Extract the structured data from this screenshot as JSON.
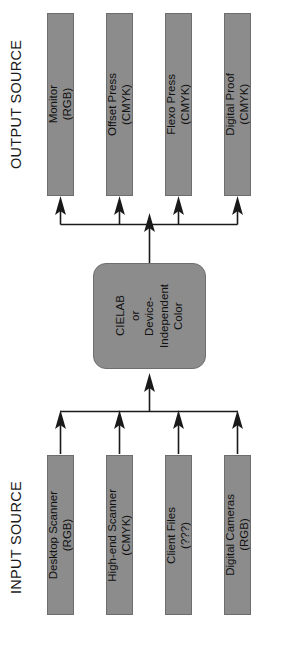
{
  "diagram": {
    "background_color": "#ffffff",
    "node_fill_color": "#8c8c8c",
    "node_border_color": "#6e6e6e",
    "connector_color": "#1a1a1a",
    "sections": {
      "output": {
        "label": "OUTPUT SOURCE",
        "nodes": [
          {
            "name": "monitor",
            "line1": "Monitor",
            "line2": "(RGB)",
            "text": "Monitor\n(RGB)"
          },
          {
            "name": "offset-press",
            "line1": "Offset Press",
            "line2": "(CMYK)",
            "text": "Offset Press\n(CMYK)"
          },
          {
            "name": "flexo-press",
            "line1": "Flexo Press",
            "line2": "(CMYK)",
            "text": "Flexo Press\n(CMYK)"
          },
          {
            "name": "digital-proof",
            "line1": "Digital Proof",
            "line2": "(CMYK)",
            "text": "Digital Proof\n(CMYK)"
          }
        ]
      },
      "hub": {
        "name": "cielab-device-independent-color",
        "text": "CIELAB\nor\nDevice-\nIndependent\nColor",
        "lines": [
          "CIELAB",
          "or",
          "Device-",
          "Independent",
          "Color"
        ]
      },
      "input": {
        "label": "INPUT SOURCE",
        "nodes": [
          {
            "name": "desktop-scanner",
            "line1": "Desktop Scanner",
            "line2": "(RGB)",
            "text": "Desktop Scanner\n(RGB)"
          },
          {
            "name": "high-end-scanner",
            "line1": "High-end Scanner",
            "line2": "(CMYK)",
            "text": "High-end Scanner\n(CMYK)"
          },
          {
            "name": "client-files",
            "line1": "Client Files",
            "line2": "(???)",
            "text": "Client Files\n(???)"
          },
          {
            "name": "digital-cameras",
            "line1": "Digital Cameras",
            "line2": "(RGB)",
            "text": "Digital Cameras\n(RGB)"
          }
        ]
      }
    }
  }
}
